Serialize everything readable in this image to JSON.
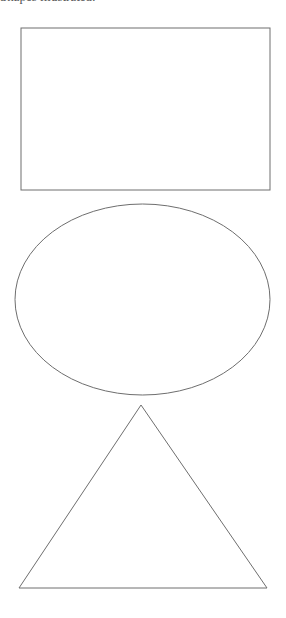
{
  "caption": {
    "text": "Shapes illustrated:",
    "clipped": true
  },
  "canvas": {
    "width": 286,
    "height": 618,
    "background": "#ffffff",
    "stroke": "#6e6e6e",
    "stroke_width": 1
  },
  "shapes": [
    {
      "kind": "rectangle",
      "label": "rectangle",
      "x": 21,
      "y": 28,
      "width": 249,
      "height": 162
    },
    {
      "kind": "ellipse",
      "label": "ellipse",
      "cx": 142.5,
      "cy": 299.5,
      "rx": 127.5,
      "ry": 95.5
    },
    {
      "kind": "triangle",
      "label": "triangle",
      "points": [
        [
          141,
          405
        ],
        [
          19,
          588
        ],
        [
          267,
          588
        ]
      ]
    }
  ]
}
